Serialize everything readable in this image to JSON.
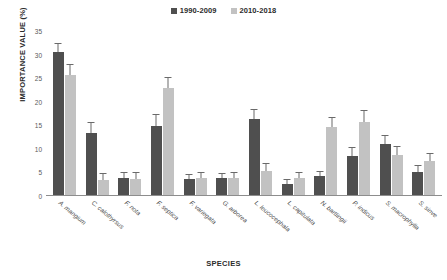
{
  "chart_data": {
    "type": "bar",
    "title": "",
    "xlabel": "SPECIES",
    "ylabel": "IMPORTANCE VALUE (%)",
    "ylim": [
      0,
      35
    ],
    "yticks": [
      0,
      5,
      10,
      15,
      20,
      25,
      30,
      35
    ],
    "grid": false,
    "legend_position": "top-center",
    "categories": [
      "A. mangium",
      "C. calothyrsus",
      "F. nota",
      "F. septica",
      "F. variegata",
      "G. arborea",
      "L. leucocephala",
      "L. capitulata",
      "N. bartlingii",
      "P. indicus",
      "S. macrophylla",
      "S. sinve"
    ],
    "series": [
      {
        "name": "1990-2009",
        "color": "#4f4f4f",
        "values": [
          30.5,
          13.3,
          3.9,
          14.9,
          3.6,
          3.8,
          16.4,
          2.5,
          4.2,
          8.5,
          11.0,
          5.2
        ],
        "errors": [
          1.8,
          2.2,
          1.0,
          2.2,
          0.9,
          0.9,
          1.9,
          0.8,
          1.0,
          1.6,
          1.8,
          1.1
        ]
      },
      {
        "name": "2010-2018",
        "color": "#c2c2c2",
        "values": [
          25.7,
          3.3,
          3.7,
          22.9,
          3.9,
          3.8,
          5.3,
          3.8,
          14.7,
          15.8,
          8.8,
          7.5
        ],
        "errors": [
          2.0,
          1.3,
          1.1,
          2.1,
          1.0,
          1.0,
          1.4,
          1.0,
          1.9,
          2.2,
          1.7,
          1.5
        ]
      }
    ]
  },
  "legend": {
    "items": [
      {
        "label": "1990-2009",
        "color": "#4f4f4f"
      },
      {
        "label": "2010-2018",
        "color": "#c2c2c2"
      }
    ]
  },
  "axes": {
    "y_title": "IMPORTANCE VALUE (%)",
    "x_title": "SPECIES"
  }
}
